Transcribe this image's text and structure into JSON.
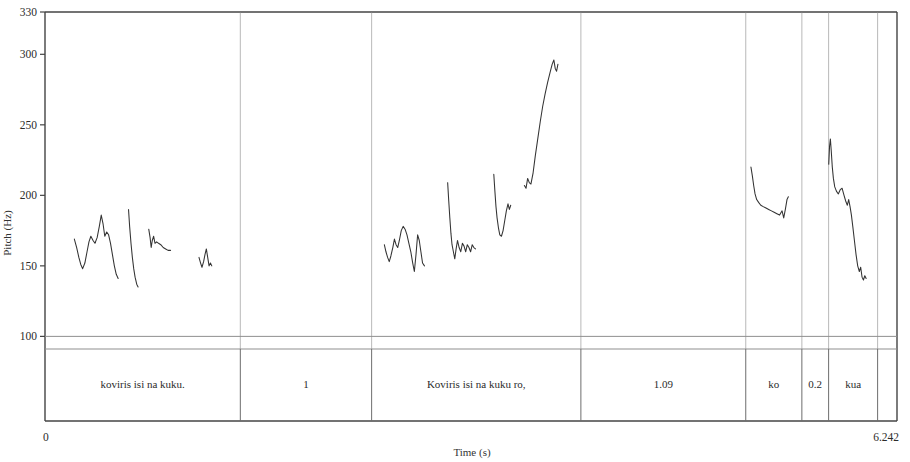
{
  "figure": {
    "background": "#ffffff",
    "line_color": "#333333",
    "frame_color": "#444444",
    "divider_color": "#8a8a8a"
  },
  "axes": {
    "y": {
      "label": "Pitch (Hz)",
      "top_label": "330",
      "ticks": [
        "330",
        "300",
        "250",
        "200",
        "150",
        "100"
      ],
      "tick_values": [
        330,
        300,
        250,
        200,
        150,
        100
      ],
      "min": 40,
      "max": 330
    },
    "x": {
      "label": "Time (s)",
      "start_label": "0",
      "end_label": "6.242",
      "min": 0,
      "max": 6.242
    }
  },
  "tier": {
    "cells": [
      {
        "label": "koviris isi na kuku.",
        "start": 0.0,
        "end": 1.431
      },
      {
        "label": "1",
        "start": 1.431,
        "end": 2.393
      },
      {
        "label": "Koviris isi na kuku ro,",
        "start": 2.393,
        "end": 3.926
      },
      {
        "label": "1.09",
        "start": 3.926,
        "end": 5.134
      },
      {
        "label": "ko",
        "start": 5.134,
        "end": 5.545
      },
      {
        "label": "0.2",
        "start": 5.545,
        "end": 5.741
      },
      {
        "label": "kua",
        "start": 5.741,
        "end": 6.1
      },
      {
        "label": "",
        "start": 6.1,
        "end": 6.242
      }
    ]
  },
  "chart_data": {
    "type": "line",
    "title": "",
    "xlabel": "Time (s)",
    "ylabel": "Pitch (Hz)",
    "xlim": [
      0,
      6.242
    ],
    "ylim": [
      40,
      330
    ],
    "grid": false,
    "legend": "none",
    "yticks": [
      330,
      300,
      250,
      200,
      150,
      100
    ],
    "xticks": [
      0,
      6.242
    ],
    "annotations": [
      "koviris isi na kuku.",
      "1",
      "Koviris isi na kuku ro,",
      "1.09",
      "ko",
      "0.2",
      "kua"
    ],
    "series": [
      {
        "name": "pitch-segment-1",
        "points": [
          [
            0.215,
            169
          ],
          [
            0.232,
            163
          ],
          [
            0.248,
            156
          ],
          [
            0.262,
            151
          ],
          [
            0.276,
            148
          ],
          [
            0.292,
            152
          ],
          [
            0.308,
            160
          ],
          [
            0.322,
            167
          ],
          [
            0.336,
            171
          ],
          [
            0.352,
            168
          ],
          [
            0.366,
            166
          ],
          [
            0.382,
            170
          ],
          [
            0.398,
            178
          ],
          [
            0.412,
            186
          ],
          [
            0.425,
            180
          ],
          [
            0.438,
            171
          ],
          [
            0.452,
            174
          ],
          [
            0.466,
            172
          ],
          [
            0.48,
            166
          ],
          [
            0.494,
            158
          ],
          [
            0.508,
            150
          ],
          [
            0.522,
            144
          ],
          [
            0.536,
            141
          ]
        ]
      },
      {
        "name": "pitch-segment-2",
        "points": [
          [
            0.612,
            190
          ],
          [
            0.62,
            178
          ],
          [
            0.63,
            166
          ],
          [
            0.64,
            156
          ],
          [
            0.65,
            148
          ],
          [
            0.66,
            142
          ],
          [
            0.672,
            137
          ],
          [
            0.682,
            135
          ]
        ]
      },
      {
        "name": "pitch-segment-3",
        "points": [
          [
            0.76,
            176
          ],
          [
            0.77,
            170
          ],
          [
            0.778,
            163
          ],
          [
            0.786,
            168
          ],
          [
            0.796,
            171
          ],
          [
            0.806,
            166
          ],
          [
            0.818,
            167
          ],
          [
            0.832,
            166
          ],
          [
            0.848,
            165
          ],
          [
            0.866,
            163
          ],
          [
            0.884,
            162
          ],
          [
            0.902,
            161
          ],
          [
            0.92,
            161
          ]
        ]
      },
      {
        "name": "pitch-segment-4",
        "points": [
          [
            1.128,
            156
          ],
          [
            1.14,
            152
          ],
          [
            1.15,
            149
          ],
          [
            1.162,
            153
          ],
          [
            1.172,
            158
          ],
          [
            1.182,
            162
          ],
          [
            1.192,
            156
          ],
          [
            1.202,
            150
          ],
          [
            1.212,
            152
          ],
          [
            1.222,
            150
          ]
        ]
      },
      {
        "name": "pitch-segment-5",
        "points": [
          [
            2.486,
            165
          ],
          [
            2.498,
            160
          ],
          [
            2.51,
            156
          ],
          [
            2.522,
            153
          ],
          [
            2.534,
            157
          ],
          [
            2.548,
            163
          ],
          [
            2.56,
            169
          ],
          [
            2.572,
            165
          ],
          [
            2.584,
            163
          ],
          [
            2.596,
            168
          ],
          [
            2.61,
            175
          ],
          [
            2.624,
            178
          ],
          [
            2.638,
            176
          ],
          [
            2.652,
            172
          ],
          [
            2.666,
            166
          ],
          [
            2.68,
            160
          ],
          [
            2.694,
            152
          ],
          [
            2.706,
            146
          ],
          [
            2.718,
            158
          ],
          [
            2.73,
            172
          ],
          [
            2.742,
            168
          ],
          [
            2.754,
            160
          ],
          [
            2.766,
            152
          ],
          [
            2.78,
            150
          ]
        ]
      },
      {
        "name": "pitch-segment-6",
        "points": [
          [
            2.95,
            209
          ],
          [
            2.958,
            196
          ],
          [
            2.966,
            184
          ],
          [
            2.974,
            173
          ],
          [
            2.982,
            165
          ],
          [
            2.992,
            160
          ],
          [
            3.002,
            155
          ],
          [
            3.012,
            162
          ],
          [
            3.022,
            168
          ],
          [
            3.034,
            163
          ],
          [
            3.046,
            160
          ],
          [
            3.058,
            166
          ],
          [
            3.07,
            164
          ],
          [
            3.082,
            160
          ],
          [
            3.094,
            165
          ],
          [
            3.106,
            163
          ],
          [
            3.118,
            160
          ],
          [
            3.13,
            165
          ],
          [
            3.142,
            163
          ],
          [
            3.154,
            162
          ]
        ]
      },
      {
        "name": "pitch-segment-7",
        "points": [
          [
            3.288,
            215
          ],
          [
            3.296,
            203
          ],
          [
            3.304,
            192
          ],
          [
            3.312,
            184
          ],
          [
            3.322,
            177
          ],
          [
            3.332,
            172
          ],
          [
            3.344,
            171
          ],
          [
            3.356,
            175
          ],
          [
            3.368,
            182
          ],
          [
            3.38,
            189
          ],
          [
            3.392,
            194
          ],
          [
            3.402,
            190
          ],
          [
            3.412,
            193
          ]
        ]
      },
      {
        "name": "pitch-segment-8",
        "points": [
          [
            3.512,
            207
          ],
          [
            3.524,
            205
          ],
          [
            3.536,
            212
          ],
          [
            3.548,
            209
          ],
          [
            3.56,
            208
          ],
          [
            3.576,
            216
          ],
          [
            3.592,
            228
          ],
          [
            3.61,
            240
          ],
          [
            3.628,
            252
          ],
          [
            3.646,
            263
          ],
          [
            3.664,
            272
          ],
          [
            3.682,
            280
          ],
          [
            3.7,
            287
          ],
          [
            3.716,
            293
          ],
          [
            3.728,
            296
          ],
          [
            3.738,
            290
          ],
          [
            3.748,
            288
          ],
          [
            3.758,
            293
          ]
        ]
      },
      {
        "name": "pitch-segment-9",
        "points": [
          [
            5.172,
            220
          ],
          [
            5.182,
            214
          ],
          [
            5.192,
            207
          ],
          [
            5.202,
            201
          ],
          [
            5.214,
            197
          ],
          [
            5.228,
            195
          ],
          [
            5.244,
            193
          ],
          [
            5.262,
            192
          ],
          [
            5.282,
            191
          ],
          [
            5.302,
            190
          ],
          [
            5.322,
            189
          ],
          [
            5.342,
            188
          ],
          [
            5.362,
            187
          ],
          [
            5.382,
            186
          ],
          [
            5.4,
            189
          ],
          [
            5.412,
            184
          ],
          [
            5.424,
            190
          ],
          [
            5.436,
            197
          ],
          [
            5.446,
            199
          ]
        ]
      },
      {
        "name": "pitch-segment-10",
        "points": [
          [
            5.742,
            222
          ],
          [
            5.748,
            235
          ],
          [
            5.754,
            240
          ],
          [
            5.76,
            232
          ],
          [
            5.768,
            220
          ],
          [
            5.776,
            212
          ],
          [
            5.786,
            206
          ],
          [
            5.798,
            203
          ],
          [
            5.812,
            201
          ],
          [
            5.826,
            204
          ],
          [
            5.84,
            205
          ],
          [
            5.854,
            200
          ],
          [
            5.866,
            196
          ],
          [
            5.878,
            193
          ],
          [
            5.888,
            197
          ],
          [
            5.898,
            192
          ],
          [
            5.908,
            186
          ],
          [
            5.918,
            178
          ],
          [
            5.93,
            168
          ],
          [
            5.942,
            158
          ],
          [
            5.954,
            150
          ],
          [
            5.966,
            146
          ],
          [
            5.976,
            149
          ],
          [
            5.986,
            142
          ],
          [
            5.996,
            140
          ],
          [
            6.006,
            143
          ],
          [
            6.016,
            141
          ]
        ]
      }
    ]
  }
}
